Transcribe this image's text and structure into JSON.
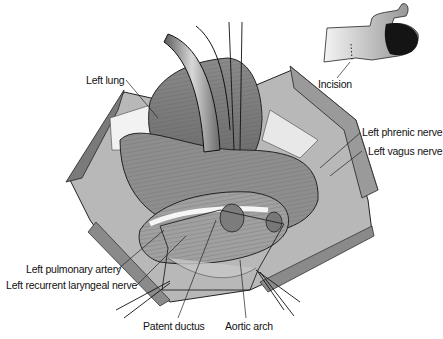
{
  "figure": {
    "labels": {
      "left_lung": "Left lung",
      "incision": "Incision",
      "left_phrenic_nerve": "Left phrenic nerve",
      "left_vagus_nerve": "Left vagus nerve",
      "left_pulmonary_artery": "Left pulmonary artery",
      "left_recurrent_laryngeal_nerve": "Left recurrent laryngeal nerve",
      "patent_ductus": "Patent ductus",
      "aortic_arch": "Aortic arch"
    },
    "colors": {
      "background": "#ffffff",
      "tissue_dark": "#6e6e6e",
      "tissue_mid": "#9a9a9a",
      "tissue_light": "#c8c8c8",
      "line": "#1a1a1a"
    }
  }
}
